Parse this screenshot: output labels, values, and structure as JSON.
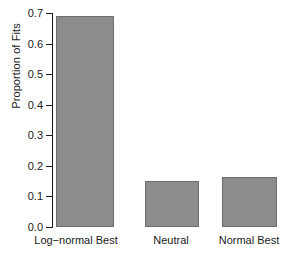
{
  "chart_data": {
    "type": "bar",
    "title": "",
    "xlabel": "",
    "ylabel": "Proportion of Fits",
    "categories": [
      "Log−normal Best",
      "Neutral",
      "Normal Best"
    ],
    "values": [
      0.69,
      0.15,
      0.165
    ],
    "ylim": [
      0.0,
      0.7
    ],
    "ytick_labels": [
      "0.0",
      "0.1",
      "0.2",
      "0.3",
      "0.4",
      "0.5",
      "0.6",
      "0.7"
    ],
    "ytick_values": [
      0.0,
      0.1,
      0.2,
      0.3,
      0.4,
      0.5,
      0.6,
      0.7
    ],
    "grid": false,
    "legend": false,
    "bar_color": "#8c8c8c",
    "bar_border_color": "#6e6e6e",
    "axis_color": "#1a1a1a",
    "background_color": "#ffffff"
  }
}
